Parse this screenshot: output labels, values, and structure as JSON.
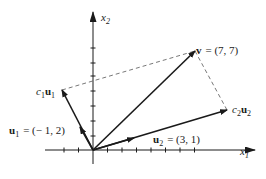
{
  "diagram": {
    "title": "",
    "axes": {
      "x_label": "x",
      "x_sub": "1",
      "y_label": "x",
      "y_sub": "2"
    },
    "vectors": {
      "v": {
        "name": "v",
        "value": "= (7, 7)",
        "coords": [
          7,
          7
        ]
      },
      "u1": {
        "name": "u",
        "sub": "1",
        "value": "= (− 1, 2)",
        "coords": [
          -1,
          2
        ]
      },
      "u2": {
        "name": "u",
        "sub": "2",
        "value": "= (3, 1)",
        "coords": [
          3,
          1
        ]
      },
      "c1u1": {
        "coef": "c",
        "coef_sub": "1",
        "name": "u",
        "sub": "1"
      },
      "c2u2": {
        "coef": "c",
        "coef_sub": "2",
        "name": "u",
        "sub": "2"
      }
    },
    "colors": {
      "ink": "#1a1a1a",
      "dashed": "#555555",
      "background": "#ffffff"
    }
  }
}
